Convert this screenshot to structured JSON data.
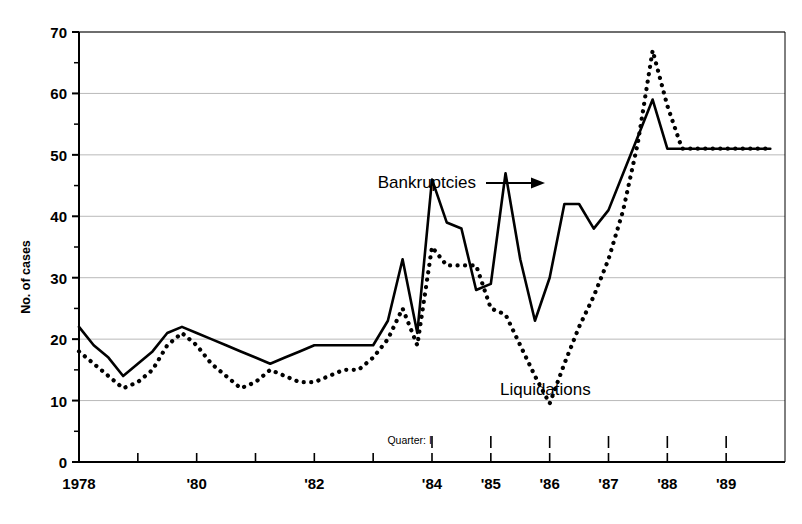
{
  "chart_data": {
    "type": "line",
    "title": "",
    "xlabel": "",
    "ylabel": "No. of cases",
    "ylim": [
      0,
      70
    ],
    "yticks": [
      0,
      10,
      20,
      30,
      40,
      50,
      60,
      70
    ],
    "yminor_step": 5,
    "grid": "horizontal-major",
    "legend": "inline-annotations",
    "xlim": [
      1978,
      1990
    ],
    "x_tick_years": [
      1978,
      1979,
      1980,
      1981,
      1982,
      1983,
      1984,
      1985,
      1986,
      1987,
      1988,
      1989,
      1990
    ],
    "xtick_labels": [
      {
        "year": 1978,
        "label": "1978"
      },
      {
        "year": 1980,
        "label": "'80"
      },
      {
        "year": 1982,
        "label": "'82"
      },
      {
        "year": 1984,
        "label": "'84"
      },
      {
        "year": 1985,
        "label": "'85"
      },
      {
        "year": 1986,
        "label": "'86"
      },
      {
        "year": 1987,
        "label": "'87"
      },
      {
        "year": 1988,
        "label": "'88"
      },
      {
        "year": 1989,
        "label": "'89"
      }
    ],
    "quarter_annotation": {
      "text": "Quarter: I",
      "marker": "I",
      "marker_years": [
        1984,
        1985,
        1986,
        1987,
        1988,
        1989
      ]
    },
    "x_unit": "quarter",
    "x_start": 1978.0,
    "x_step": 0.25,
    "series": [
      {
        "name": "Bankruptcies",
        "style": "solid",
        "color": "#000000",
        "values": [
          22,
          19,
          17,
          14,
          16,
          18,
          21,
          22,
          21,
          20,
          19,
          18,
          17,
          16,
          17,
          18,
          19,
          19,
          19,
          19,
          19,
          23,
          33,
          21,
          46,
          39,
          38,
          28,
          29,
          47,
          33,
          23,
          30,
          42,
          42,
          38,
          41,
          47,
          53,
          59,
          51,
          51,
          51,
          51,
          51,
          51,
          51,
          51
        ]
      },
      {
        "name": "Liquidations",
        "style": "dotted",
        "color": "#000000",
        "values": [
          18,
          16,
          14,
          12,
          13,
          15,
          19,
          21,
          19,
          16,
          14,
          12,
          13,
          15,
          14,
          13,
          13,
          14,
          15,
          15,
          17,
          20,
          25,
          19,
          35,
          32,
          32,
          32,
          25,
          24,
          19,
          14,
          9.5,
          16,
          22,
          27,
          33,
          41,
          52,
          67,
          58,
          51,
          51,
          51,
          51,
          51,
          51,
          51
        ]
      }
    ],
    "annotations": [
      {
        "text": "Bankruptcies",
        "points_to": "solid-line",
        "arrow": "right"
      },
      {
        "text": "Liquidations",
        "points_to": "dotted-line",
        "arrow": "none"
      }
    ]
  },
  "axis": {
    "y_label_text": "No. of cases"
  }
}
